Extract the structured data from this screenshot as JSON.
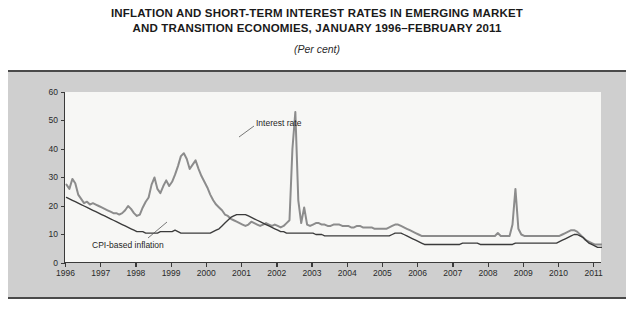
{
  "title": {
    "line1": "INFLATION AND SHORT-TERM INTEREST RATES IN EMERGING MARKET",
    "line2": "AND TRANSITION ECONOMIES, JANUARY 1996–FEBRUARY 2011",
    "subtitle": "(Per cent)"
  },
  "colors": {
    "interest_rate": "#8c8c8c",
    "inflation": "#3b3b3b",
    "plot_background": "#f7f7f5",
    "panel_background": "#cfcfcf",
    "axis": "#3a3a3a",
    "rule": "#4a4a4a"
  },
  "annotations": {
    "interest_rate": "Interest rate",
    "inflation": "CPI-based inflation"
  },
  "chart_data": {
    "type": "line",
    "title": "INFLATION AND SHORT-TERM INTEREST RATES IN EMERGING MARKET AND TRANSITION ECONOMIES, JANUARY 1996–FEBRUARY 2011",
    "subtitle": "(Per cent)",
    "xlabel": "",
    "ylabel": "",
    "ylim": [
      0,
      60
    ],
    "yticks": [
      0,
      10,
      20,
      30,
      40,
      50,
      60
    ],
    "xlim": [
      "1996-01",
      "2011-02"
    ],
    "xticks": [
      "1996",
      "1997",
      "1998",
      "1999",
      "2000",
      "2001",
      "2002",
      "2003",
      "2004",
      "2005",
      "2006",
      "2007",
      "2008",
      "2009",
      "2010",
      "2011"
    ],
    "grid": false,
    "legend": "inline-annotations",
    "x_start": "1996-01",
    "x_step": "monthly",
    "n_points": 182,
    "series": [
      {
        "name": "Interest rate",
        "color": "#8c8c8c",
        "values": [
          27.5,
          26.0,
          29.5,
          28.0,
          24.0,
          22.5,
          21.0,
          21.5,
          20.5,
          21.0,
          20.5,
          20.0,
          19.5,
          19.0,
          18.5,
          18.0,
          17.5,
          17.5,
          17.0,
          17.5,
          18.5,
          20.0,
          19.0,
          17.5,
          16.5,
          17.0,
          19.5,
          21.5,
          23.0,
          27.5,
          30.0,
          26.0,
          24.5,
          27.0,
          29.0,
          27.0,
          28.5,
          31.0,
          34.0,
          37.5,
          38.5,
          36.5,
          33.0,
          34.5,
          36.0,
          33.0,
          30.5,
          28.5,
          26.5,
          24.0,
          22.0,
          20.5,
          19.5,
          18.5,
          17.0,
          16.5,
          15.5,
          15.0,
          14.5,
          14.0,
          13.5,
          13.0,
          13.5,
          14.5,
          14.0,
          13.5,
          13.0,
          13.5,
          14.0,
          13.5,
          13.0,
          13.5,
          13.0,
          12.5,
          13.0,
          14.0,
          15.0,
          40.0,
          53.0,
          22.0,
          14.0,
          19.5,
          13.5,
          13.0,
          13.5,
          14.0,
          14.0,
          13.5,
          13.5,
          13.0,
          13.0,
          13.5,
          13.5,
          13.5,
          13.0,
          13.0,
          13.0,
          12.5,
          12.5,
          13.0,
          13.0,
          12.5,
          12.5,
          12.5,
          12.5,
          12.0,
          12.0,
          12.0,
          12.0,
          12.0,
          12.5,
          13.0,
          13.5,
          13.5,
          13.0,
          12.5,
          12.0,
          11.5,
          11.0,
          10.5,
          10.0,
          9.5,
          9.5,
          9.5,
          9.5,
          9.5,
          9.5,
          9.5,
          9.5,
          9.5,
          9.5,
          9.5,
          9.5,
          9.5,
          9.5,
          9.5,
          9.5,
          9.5,
          9.5,
          9.5,
          9.5,
          9.5,
          9.5,
          9.5,
          9.5,
          9.5,
          9.5,
          10.5,
          9.5,
          9.5,
          9.5,
          9.5,
          13.5,
          26.0,
          12.0,
          10.0,
          9.5,
          9.5,
          9.5,
          9.5,
          9.5,
          9.5,
          9.5,
          9.5,
          9.5,
          9.5,
          9.5,
          9.5,
          9.5,
          10.0,
          10.5,
          11.0,
          11.5,
          11.5,
          11.0,
          10.0,
          9.0,
          8.0,
          7.5,
          7.0,
          6.5,
          6.5,
          6.5,
          6.5,
          6.5,
          6.5,
          6.5,
          7.0,
          7.5,
          7.5,
          7.5,
          7.0,
          7.0,
          7.0,
          6.5,
          6.0,
          5.5,
          5.5,
          5.5,
          5.5,
          5.5,
          5.5,
          5.5,
          5.0,
          5.0,
          5.0
        ]
      },
      {
        "name": "CPI-based inflation",
        "color": "#3b3b3b",
        "values": [
          23.0,
          22.5,
          22.0,
          21.5,
          21.0,
          20.5,
          20.0,
          19.5,
          19.0,
          18.5,
          18.0,
          17.5,
          17.0,
          16.5,
          16.0,
          15.5,
          15.0,
          14.5,
          14.0,
          13.5,
          13.0,
          12.5,
          12.0,
          11.5,
          11.0,
          11.0,
          11.0,
          10.5,
          10.5,
          10.5,
          10.5,
          10.5,
          11.0,
          11.0,
          11.0,
          11.0,
          11.0,
          11.5,
          11.0,
          10.5,
          10.5,
          10.5,
          10.5,
          10.5,
          10.5,
          10.5,
          10.5,
          10.5,
          10.5,
          10.5,
          11.0,
          11.5,
          12.0,
          13.0,
          14.0,
          15.0,
          16.0,
          16.5,
          17.0,
          17.0,
          17.0,
          17.0,
          16.5,
          16.0,
          15.5,
          15.0,
          14.5,
          14.0,
          13.5,
          13.0,
          12.5,
          12.0,
          11.5,
          11.0,
          11.0,
          10.5,
          10.5,
          10.5,
          10.5,
          10.5,
          10.5,
          10.5,
          10.5,
          10.5,
          10.5,
          10.0,
          10.0,
          10.0,
          9.5,
          9.5,
          9.5,
          9.5,
          9.5,
          9.5,
          9.5,
          9.5,
          9.5,
          9.5,
          9.5,
          9.5,
          9.5,
          9.5,
          9.5,
          9.5,
          9.5,
          9.5,
          9.5,
          9.5,
          9.5,
          9.5,
          9.5,
          10.0,
          10.5,
          10.5,
          10.5,
          10.0,
          9.5,
          9.0,
          8.5,
          8.0,
          7.5,
          7.0,
          6.5,
          6.5,
          6.5,
          6.5,
          6.5,
          6.5,
          6.5,
          6.5,
          6.5,
          6.5,
          6.5,
          6.5,
          6.5,
          7.0,
          7.0,
          7.0,
          7.0,
          7.0,
          7.0,
          6.5,
          6.5,
          6.5,
          6.5,
          6.5,
          6.5,
          6.5,
          6.5,
          6.5,
          6.5,
          6.5,
          6.5,
          7.0,
          7.0,
          7.0,
          7.0,
          7.0,
          7.0,
          7.0,
          7.0,
          7.0,
          7.0,
          7.0,
          7.0,
          7.0,
          7.0,
          7.0,
          7.5,
          8.0,
          8.5,
          9.0,
          9.5,
          10.0,
          10.0,
          9.5,
          9.0,
          8.0,
          7.0,
          6.5,
          6.0,
          5.5,
          5.5,
          5.5,
          5.5,
          5.5,
          5.5,
          6.0,
          6.5,
          6.5,
          6.5,
          6.5,
          6.5,
          6.5,
          6.0,
          6.0,
          5.5,
          5.5,
          5.5,
          5.5,
          5.5,
          5.5,
          5.5,
          5.0,
          5.0,
          5.0
        ]
      }
    ]
  }
}
